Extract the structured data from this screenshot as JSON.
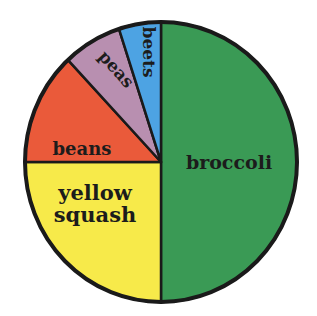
{
  "chart_data": {
    "type": "pie",
    "title": "",
    "start_angle_deg": 0,
    "direction": "clockwise",
    "slices": [
      {
        "label": "broccoli",
        "value": 50,
        "color": "#3a9a55"
      },
      {
        "label": "yellow squash",
        "value": 25,
        "color": "#f7ea4a"
      },
      {
        "label": "beans",
        "value": 13,
        "color": "#ea5a3a"
      },
      {
        "label": "peas",
        "value": 7,
        "color": "#b88fb0"
      },
      {
        "label": "beets",
        "value": 5,
        "color": "#4da3e3"
      }
    ],
    "legend": "none",
    "labels_on_slices": true
  },
  "labels": {
    "broccoli": "broccoli",
    "yellow": "yellow",
    "squash": "squash",
    "beans": "beans",
    "peas": "peas",
    "beets": "beets"
  }
}
